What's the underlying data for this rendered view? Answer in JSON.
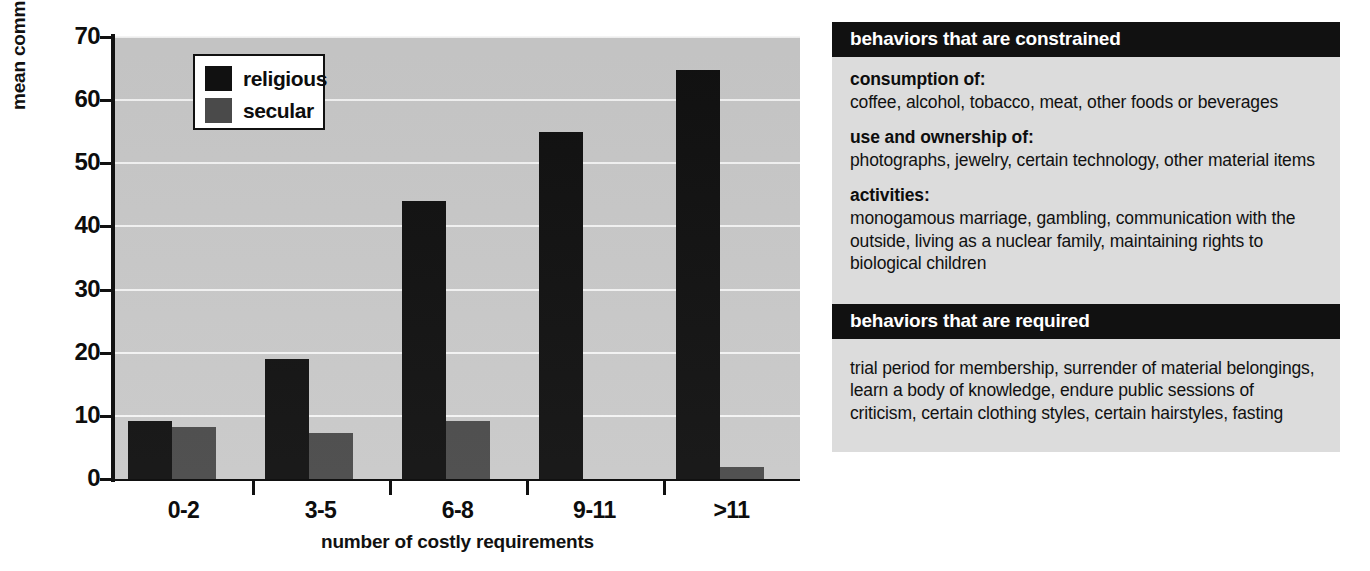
{
  "chart_data": {
    "type": "bar",
    "title": "",
    "xlabel": "number of costly requirements",
    "ylabel": "mean commune duration (years)",
    "categories": [
      "0-2",
      "3-5",
      "6-8",
      "9-11",
      ">11"
    ],
    "yticks": [
      0,
      10,
      20,
      30,
      40,
      50,
      60,
      70
    ],
    "ylim": [
      0,
      70
    ],
    "grid": true,
    "legend_position": "top-left-inside",
    "series": [
      {
        "name": "religious",
        "color": "#111111",
        "values": [
          9.2,
          19.0,
          44.0,
          55.0,
          64.7
        ]
      },
      {
        "name": "secular",
        "color": "#4a4a4a",
        "values": [
          8.3,
          7.3,
          9.2,
          0.0,
          1.9
        ]
      }
    ],
    "plot_background": "#c9c9c9",
    "gridline_color": "#f4f4f4"
  },
  "legend": {
    "items": [
      {
        "label": "religious",
        "swatch": "religious"
      },
      {
        "label": "secular",
        "swatch": "secular"
      }
    ]
  },
  "side_panel": {
    "constrained": {
      "header": "behaviors that are constrained",
      "groups": [
        {
          "title": "consumption of:",
          "text": "coffee, alcohol, tobacco, meat, other foods or beverages"
        },
        {
          "title": "use and ownership of:",
          "text": "photographs, jewelry, certain technology, other material items"
        },
        {
          "title": "activities:",
          "text": "monogamous marriage, gambling, communication with the outside, living as a nuclear family, maintaining rights to biological children"
        }
      ]
    },
    "required": {
      "header": "behaviors that are required",
      "text": "trial period for membership, surrender of material belongings, learn a body of knowledge, endure public sessions of criticism, certain clothing styles, certain hairstyles, fasting"
    }
  }
}
